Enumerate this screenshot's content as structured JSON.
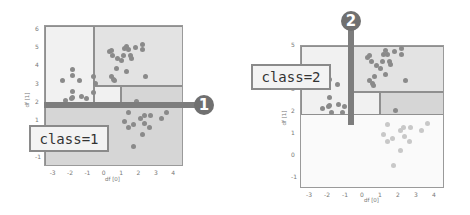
{
  "colors": {
    "axes_border": "#9a9a9a",
    "region_light": "#f1f1f1",
    "region_mid": "#e3e3e3",
    "region_dark": "#d6d6d6",
    "region_faint": "#fafafa",
    "point_dark": "#8a8a8a",
    "point_faint": "#c8c8c8",
    "split_bar": "#7d7d7d",
    "badge": "#707070"
  },
  "panels": [
    {
      "id": "left",
      "step_badge": "1",
      "class_label": "class=1",
      "xlabel": "df [0]",
      "ylabel": "df [1]",
      "xticks": [
        "-3",
        "-2",
        "-1",
        "0",
        "1",
        "2",
        "3",
        "4"
      ],
      "yticks": [
        "6",
        "5",
        "4",
        "3",
        "2",
        "1",
        "0",
        "-1"
      ]
    },
    {
      "id": "right",
      "step_badge": "2",
      "class_label": "class=2",
      "xlabel": "df [0]",
      "ylabel": "df [1]",
      "xticks": [
        "-3",
        "-2",
        "-1",
        "0",
        "1",
        "2",
        "3",
        "4"
      ],
      "yticks": [
        "5",
        "3",
        "2",
        "1",
        "0",
        "-1"
      ]
    }
  ],
  "chart_data": [
    {
      "type": "scatter",
      "title": "Decision tree split 1: horizontal split on df[1]",
      "xlabel": "df [0]",
      "ylabel": "df [1]",
      "xlim": [
        -3.5,
        4.5
      ],
      "ylim": [
        -1.5,
        6.2
      ],
      "split": {
        "feature": "df[1]",
        "threshold": 1.85,
        "orientation": "horizontal"
      },
      "annotation": "class=1",
      "step": 1,
      "regions": [
        {
          "x": [
            -3.5,
            -0.7
          ],
          "y": [
            1.85,
            6.2
          ],
          "shade": "light"
        },
        {
          "x": [
            -0.7,
            4.5
          ],
          "y": [
            2.9,
            6.2
          ],
          "shade": "mid"
        },
        {
          "x": [
            -0.7,
            0.9
          ],
          "y": [
            1.85,
            2.9
          ],
          "shade": "light"
        },
        {
          "x": [
            0.9,
            4.5
          ],
          "y": [
            1.85,
            2.9
          ],
          "shade": "dark"
        },
        {
          "x": [
            -3.5,
            4.5
          ],
          "y": [
            -1.5,
            1.85
          ],
          "shade": "dark"
        }
      ],
      "series": [
        {
          "name": "cluster upper-right",
          "points": [
            [
              0.2,
              4.8
            ],
            [
              0.3,
              4.85
            ],
            [
              0.4,
              4.6
            ],
            [
              0.7,
              4.4
            ],
            [
              0.9,
              4.3
            ],
            [
              1.0,
              4.6
            ],
            [
              1.1,
              4.95
            ],
            [
              1.2,
              5.1
            ],
            [
              1.3,
              4.9
            ],
            [
              1.4,
              4.6
            ],
            [
              1.45,
              4.45
            ],
            [
              1.7,
              5.05
            ],
            [
              2.1,
              5.2
            ],
            [
              2.1,
              4.9
            ],
            [
              0.6,
              3.9
            ],
            [
              0.3,
              3.45
            ],
            [
              0.45,
              3.3
            ],
            [
              0.5,
              3.2
            ],
            [
              1.2,
              3.7
            ],
            [
              2.3,
              3.45
            ]
          ]
        },
        {
          "name": "cluster left",
          "points": [
            [
              -2.5,
              3.2
            ],
            [
              -1.9,
              3.85
            ],
            [
              -1.9,
              3.5
            ],
            [
              -1.5,
              3.25
            ],
            [
              -1.9,
              2.65
            ],
            [
              -2.0,
              2.25
            ],
            [
              -1.9,
              2.3
            ],
            [
              -1.4,
              2.35
            ],
            [
              -1.1,
              2.25
            ],
            [
              -2.3,
              2.15
            ],
            [
              -0.7,
              2.55
            ],
            [
              -0.7,
              3.45
            ],
            [
              -0.6,
              3.05
            ]
          ]
        },
        {
          "name": "cluster lower-right",
          "points": [
            [
              1.3,
              1.45
            ],
            [
              1.1,
              1.0
            ],
            [
              1.3,
              0.65
            ],
            [
              1.6,
              0.8
            ],
            [
              1.75,
              2.05
            ],
            [
              2.0,
              1.15
            ],
            [
              2.2,
              1.3
            ],
            [
              2.25,
              0.9
            ],
            [
              2.5,
              0.65
            ],
            [
              2.6,
              1.3
            ],
            [
              3.2,
              1.15
            ],
            [
              3.5,
              1.5
            ],
            [
              2.1,
              0.3
            ],
            [
              1.6,
              -0.4
            ]
          ]
        }
      ]
    },
    {
      "type": "scatter",
      "title": "Decision tree split 2: vertical split on df[0]",
      "xlabel": "df [0]",
      "ylabel": "df [1]",
      "xlim": [
        -3.5,
        4.5
      ],
      "ylim": [
        -1.5,
        5.0
      ],
      "split": {
        "feature": "df[0]",
        "threshold": -0.7,
        "orientation": "vertical"
      },
      "annotation": "class=2",
      "step": 2,
      "regions": [
        {
          "x": [
            -3.5,
            -0.7
          ],
          "y": [
            1.85,
            5.0
          ],
          "shade": "light"
        },
        {
          "x": [
            -0.7,
            4.5
          ],
          "y": [
            2.9,
            5.0
          ],
          "shade": "mid"
        },
        {
          "x": [
            -0.7,
            0.9
          ],
          "y": [
            1.85,
            2.9
          ],
          "shade": "light"
        },
        {
          "x": [
            0.9,
            4.5
          ],
          "y": [
            1.85,
            2.9
          ],
          "shade": "dark"
        },
        {
          "x": [
            -3.5,
            4.5
          ],
          "y": [
            -1.5,
            1.85
          ],
          "shade": "faint"
        }
      ],
      "series": [
        {
          "name": "cluster upper-right",
          "points": [
            [
              0.2,
              4.5
            ],
            [
              0.3,
              4.55
            ],
            [
              0.4,
              4.3
            ],
            [
              0.7,
              4.1
            ],
            [
              0.9,
              4.0
            ],
            [
              1.0,
              4.3
            ],
            [
              1.1,
              4.6
            ],
            [
              1.2,
              4.8
            ],
            [
              1.3,
              4.6
            ],
            [
              1.4,
              4.3
            ],
            [
              1.45,
              4.15
            ],
            [
              1.7,
              4.75
            ],
            [
              2.1,
              4.9
            ],
            [
              2.1,
              4.6
            ],
            [
              0.6,
              3.6
            ],
            [
              0.3,
              3.45
            ],
            [
              0.45,
              3.3
            ],
            [
              0.5,
              3.2
            ],
            [
              1.2,
              3.7
            ],
            [
              2.3,
              3.45
            ]
          ]
        },
        {
          "name": "cluster left",
          "points": [
            [
              -2.5,
              3.2
            ],
            [
              -1.9,
              3.5
            ],
            [
              -1.5,
              3.25
            ],
            [
              -1.9,
              2.65
            ],
            [
              -2.0,
              2.25
            ],
            [
              -1.9,
              2.3
            ],
            [
              -1.4,
              2.35
            ],
            [
              -1.1,
              2.25
            ],
            [
              -2.3,
              2.15
            ],
            [
              -1.8,
              2.0
            ],
            [
              -1.2,
              2.0
            ]
          ]
        },
        {
          "name": "cluster lower-right (faded)",
          "points": [
            [
              1.3,
              1.45
            ],
            [
              1.1,
              1.0
            ],
            [
              1.3,
              0.65
            ],
            [
              1.6,
              0.8
            ],
            [
              1.75,
              2.05
            ],
            [
              2.0,
              1.15
            ],
            [
              2.2,
              1.3
            ],
            [
              2.25,
              0.9
            ],
            [
              2.5,
              0.65
            ],
            [
              2.6,
              1.3
            ],
            [
              3.2,
              1.15
            ],
            [
              3.5,
              1.5
            ],
            [
              2.0,
              0.25
            ],
            [
              1.65,
              -0.45
            ]
          ]
        }
      ]
    }
  ]
}
